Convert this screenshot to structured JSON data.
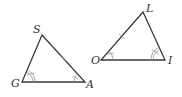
{
  "figure": {
    "colors": {
      "stroke": "#3a3a3a",
      "marks": "#8a8a8a",
      "label": "#333333",
      "background": "#ffffff"
    },
    "triangles": [
      {
        "name": "triangle-SGA",
        "vertices": [
          {
            "label": "S",
            "x": 42,
            "y": 35
          },
          {
            "label": "G",
            "x": 22,
            "y": 82
          },
          {
            "label": "A",
            "x": 85,
            "y": 82
          }
        ],
        "side_ticks": [
          {
            "side": "SA",
            "count": 1
          }
        ],
        "angle_marks": [
          {
            "vertex": "G",
            "arcs": 2,
            "ticks": 1
          },
          {
            "vertex": "A",
            "arcs": 1,
            "ticks": 1
          }
        ]
      },
      {
        "name": "triangle-LOI",
        "vertices": [
          {
            "label": "L",
            "x": 143,
            "y": 12
          },
          {
            "label": "O",
            "x": 101,
            "y": 60
          },
          {
            "label": "I",
            "x": 165,
            "y": 60
          }
        ],
        "side_ticks": [
          {
            "side": "OL",
            "count": 1
          }
        ],
        "angle_marks": [
          {
            "vertex": "O",
            "arcs": 1,
            "ticks": 1
          },
          {
            "vertex": "I",
            "arcs": 2,
            "ticks": 1
          }
        ]
      }
    ],
    "labels": {
      "S": "S",
      "G": "G",
      "A": "A",
      "L": "L",
      "O": "O",
      "I": "I"
    }
  }
}
